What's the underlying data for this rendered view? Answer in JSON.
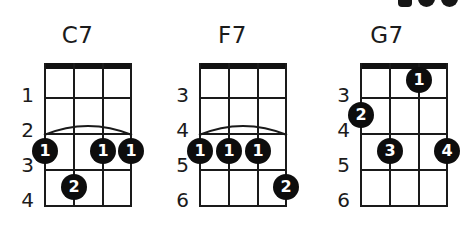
{
  "page": {
    "background_color": "#ffffff",
    "ink_color": "#1a1a1a",
    "dot_color": "#0d0d0d",
    "dot_text_color": "#ffffff",
    "instrument": "4-string (ukulele/banjo) chord diagrams",
    "cropped_artifact_top_right": true
  },
  "chord_data": {
    "type": "chord-diagram-set",
    "string_count": 4,
    "chords": [
      {
        "name": "C7",
        "fret_labels": [
          "1",
          "2",
          "3",
          "4"
        ],
        "fret_count": 4,
        "barre": {
          "present": true,
          "fret_index": 2,
          "from_string": 1,
          "to_string": 4
        },
        "dots": [
          {
            "string": 1,
            "fret_index": 2,
            "finger": "1"
          },
          {
            "string": 3,
            "fret_index": 2,
            "finger": "1"
          },
          {
            "string": 4,
            "fret_index": 2,
            "finger": "1"
          },
          {
            "string": 2,
            "fret_index": 3,
            "finger": "2"
          }
        ]
      },
      {
        "name": "F7",
        "fret_labels": [
          "3",
          "4",
          "5",
          "6"
        ],
        "fret_count": 4,
        "barre": {
          "present": true,
          "fret_index": 2,
          "from_string": 1,
          "to_string": 4
        },
        "dots": [
          {
            "string": 1,
            "fret_index": 2,
            "finger": "1"
          },
          {
            "string": 2,
            "fret_index": 2,
            "finger": "1"
          },
          {
            "string": 3,
            "fret_index": 2,
            "finger": "1"
          },
          {
            "string": 4,
            "fret_index": 3,
            "finger": "2"
          }
        ]
      },
      {
        "name": "G7",
        "fret_labels": [
          "3",
          "4",
          "5",
          "6"
        ],
        "fret_count": 4,
        "barre": {
          "present": false
        },
        "dots": [
          {
            "string": 3,
            "fret_index": 0,
            "finger": "1"
          },
          {
            "string": 1,
            "fret_index": 1,
            "finger": "2"
          },
          {
            "string": 2,
            "fret_index": 2,
            "finger": "3"
          },
          {
            "string": 4,
            "fret_index": 2,
            "finger": "4"
          }
        ]
      }
    ]
  },
  "chords": {
    "c7": {
      "title": "C7",
      "frets": {
        "f0": "1",
        "f1": "2",
        "f2": "3",
        "f3": "4"
      },
      "dots": {
        "d0": "1",
        "d1": "1",
        "d2": "1",
        "d3": "2"
      }
    },
    "f7": {
      "title": "F7",
      "frets": {
        "f0": "3",
        "f1": "4",
        "f2": "5",
        "f3": "6"
      },
      "dots": {
        "d0": "1",
        "d1": "1",
        "d2": "1",
        "d3": "2"
      }
    },
    "g7": {
      "title": "G7",
      "frets": {
        "f0": "3",
        "f1": "4",
        "f2": "5",
        "f3": "6"
      },
      "dots": {
        "d0": "1",
        "d1": "2",
        "d2": "3",
        "d3": "4"
      }
    }
  }
}
